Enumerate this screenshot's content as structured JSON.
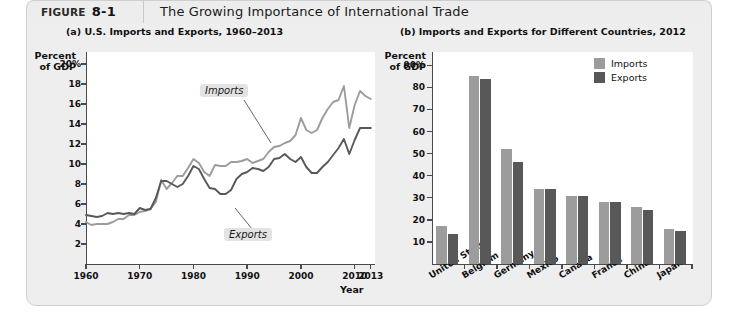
{
  "figure": {
    "tab_word": "FIGURE",
    "tab_number": "8-1",
    "title": "The Growing Importance of International Trade"
  },
  "colors": {
    "imports": "#9c9c9c",
    "exports": "#585859",
    "axis": "#4a4a4a",
    "panel_bg": "#eeeeee",
    "plot_bg": "#ffffff"
  },
  "panel_a": {
    "title": "(a) U.S. Imports and Exports, 1960–2013",
    "axis_label_line1": "Percent",
    "axis_label_line2": "of GDP",
    "xaxis_name": "Year",
    "yticks": [
      "20%",
      "18",
      "16",
      "14",
      "12",
      "10",
      "8",
      "6",
      "4",
      "2"
    ],
    "xticks": [
      "1960",
      "1970",
      "1980",
      "1990",
      "2000",
      "2010",
      "2013"
    ],
    "annotation_imports": "Imports",
    "annotation_exports": "Exports"
  },
  "panel_b": {
    "title": "(b) Imports and Exports for Different Countries, 2012",
    "axis_label_line1": "Percent",
    "axis_label_line2": "of GDP",
    "yticks": [
      "90%",
      "80",
      "70",
      "60",
      "50",
      "40",
      "30",
      "20",
      "10"
    ],
    "legend": [
      {
        "label": "Imports",
        "color": "#9c9c9c"
      },
      {
        "label": "Exports",
        "color": "#585859"
      }
    ]
  },
  "chart_data": [
    {
      "type": "line",
      "title": "(a) U.S. Imports and Exports, 1960–2013",
      "xlabel": "Year",
      "ylabel": "Percent of GDP",
      "xlim": [
        1960,
        2013
      ],
      "ylim": [
        0,
        20
      ],
      "yticks": [
        2,
        4,
        6,
        8,
        10,
        12,
        14,
        16,
        18,
        20
      ],
      "xticks": [
        1960,
        1970,
        1980,
        1990,
        2000,
        2010,
        2013
      ],
      "grid": false,
      "legend_position": "inline-annotations",
      "x": [
        1960,
        1961,
        1962,
        1963,
        1964,
        1965,
        1966,
        1967,
        1968,
        1969,
        1970,
        1971,
        1972,
        1973,
        1974,
        1975,
        1976,
        1977,
        1978,
        1979,
        1980,
        1981,
        1982,
        1983,
        1984,
        1985,
        1986,
        1987,
        1988,
        1989,
        1990,
        1991,
        1992,
        1993,
        1994,
        1995,
        1996,
        1997,
        1998,
        1999,
        2000,
        2001,
        2002,
        2003,
        2004,
        2005,
        2006,
        2007,
        2008,
        2009,
        2010,
        2011,
        2012,
        2013
      ],
      "series": [
        {
          "name": "Imports",
          "color": "#9c9c9c",
          "values": [
            4.2,
            3.9,
            4.0,
            4.0,
            4.0,
            4.2,
            4.5,
            4.5,
            4.9,
            4.9,
            5.2,
            5.3,
            5.5,
            6.2,
            8.4,
            7.5,
            8.1,
            8.8,
            8.8,
            9.6,
            10.5,
            10.1,
            9.2,
            8.8,
            9.9,
            9.8,
            9.8,
            10.2,
            10.2,
            10.3,
            10.5,
            10.1,
            10.3,
            10.5,
            11.2,
            11.7,
            11.8,
            12.1,
            12.3,
            12.9,
            14.6,
            13.4,
            13.1,
            13.4,
            14.6,
            15.5,
            16.2,
            16.4,
            17.8,
            13.6,
            15.9,
            17.3,
            16.8,
            16.5
          ]
        },
        {
          "name": "Exports",
          "color": "#585859",
          "values": [
            4.9,
            4.8,
            4.7,
            4.8,
            5.1,
            5.0,
            5.1,
            5.0,
            5.1,
            5.0,
            5.6,
            5.4,
            5.5,
            6.6,
            8.3,
            8.3,
            8.0,
            7.7,
            8.0,
            8.8,
            9.8,
            9.5,
            8.5,
            7.6,
            7.5,
            7.0,
            7.0,
            7.4,
            8.5,
            9.0,
            9.2,
            9.6,
            9.5,
            9.3,
            9.7,
            10.5,
            10.6,
            11.0,
            10.5,
            10.2,
            10.7,
            9.7,
            9.1,
            9.1,
            9.7,
            10.2,
            10.9,
            11.6,
            12.5,
            11.0,
            12.4,
            13.6,
            13.6,
            13.6
          ]
        }
      ],
      "annotations": [
        {
          "text": "Imports",
          "style": "italic-callout"
        },
        {
          "text": "Exports",
          "style": "italic-callout"
        }
      ]
    },
    {
      "type": "bar",
      "title": "(b) Imports and Exports for Different Countries, 2012",
      "xlabel": "",
      "ylabel": "Percent of GDP",
      "ylim": [
        0,
        90
      ],
      "yticks": [
        10,
        20,
        30,
        40,
        50,
        60,
        70,
        80,
        90
      ],
      "grid": false,
      "legend_position": "top-right",
      "categories": [
        "United States",
        "Belgium",
        "Germany",
        "Mexico",
        "Canada",
        "France",
        "China",
        "Japan"
      ],
      "series": [
        {
          "name": "Imports",
          "color": "#9c9c9c",
          "values": [
            17,
            85,
            52,
            34,
            31,
            28,
            26,
            16
          ]
        },
        {
          "name": "Exports",
          "color": "#585859",
          "values": [
            13.5,
            84,
            46,
            34,
            31,
            28,
            24.5,
            15
          ]
        }
      ]
    }
  ]
}
